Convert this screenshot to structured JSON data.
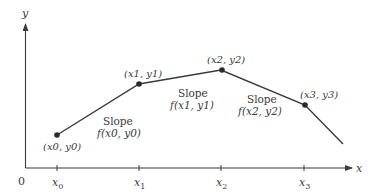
{
  "diagram": {
    "type": "euler-method-piecewise-linear",
    "axes": {
      "origin_label": "0",
      "x_label": "x",
      "y_label": "y"
    },
    "ticks": [
      {
        "label": "x",
        "sub": "0"
      },
      {
        "label": "x",
        "sub": "1"
      },
      {
        "label": "x",
        "sub": "2"
      },
      {
        "label": "x",
        "sub": "3"
      }
    ],
    "points": [
      {
        "label": "(x0, y0)"
      },
      {
        "label": "(x1, y1)"
      },
      {
        "label": "(x2, y2)"
      },
      {
        "label": "(x3, y3)"
      }
    ],
    "segments": [
      {
        "slope_title": "Slope",
        "slope_expr": "f(x0, y0)"
      },
      {
        "slope_title": "Slope",
        "slope_expr": "f(x1, y1)"
      },
      {
        "slope_title": "Slope",
        "slope_expr": "f(x2, y2)"
      }
    ],
    "colors": {
      "line": "#3a3a3a",
      "point": "#2a2a2a",
      "text": "#3a3a3a"
    }
  }
}
